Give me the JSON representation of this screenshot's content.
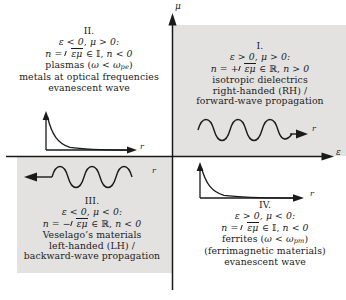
{
  "figure": {
    "name": "epsilon-mu-quadrant-diagram",
    "axis_vertical_label": "μ",
    "axis_horizontal_label": "ε",
    "shade_color": "#e3e2e0",
    "ink_color": "#1a1a1a"
  },
  "quadrants": {
    "q1": {
      "numeral": "I.",
      "condition": "ε > 0, μ > 0:",
      "index_prefix": "n = +",
      "index_radicand": "εμ",
      "index_set": "∈ ℝ,",
      "index_sign": "n > 0",
      "desc1": "isotropic dielectrics",
      "desc2": "right-handed (RH) /",
      "desc3": "forward-wave propagation",
      "inset": {
        "type": "forward-wave",
        "direction": "right",
        "label": "r",
        "cycles": 3
      }
    },
    "q2": {
      "numeral": "II.",
      "condition": "ε < 0, μ > 0:",
      "index_prefix": "n = ",
      "index_radicand": "εμ",
      "index_set": "∈ 𝕀,",
      "index_sign": "n < 0",
      "desc1_pre": "plasmas (",
      "desc1_omega": "ω",
      "desc1_mid": " < ",
      "desc1_omega2": "ω",
      "desc1_sub": "pe",
      "desc1_post": ")",
      "desc2": "metals at optical frequencies",
      "desc3": "evanescent wave",
      "inset": {
        "type": "evanescent-decay",
        "label": "r"
      }
    },
    "q3": {
      "numeral": "III.",
      "condition": "ε < 0, μ < 0:",
      "index_prefix": "n = −",
      "index_radicand": "εμ",
      "index_set": "∈ ℝ,",
      "index_sign": "n < 0",
      "desc1": "Veselago’s materials",
      "desc2": "left-handed (LH) /",
      "desc3": "backward-wave propagation",
      "inset": {
        "type": "backward-wave",
        "direction": "left",
        "label": "r",
        "cycles": 3
      }
    },
    "q4": {
      "numeral": "IV.",
      "condition": "ε > 0, μ < 0:",
      "index_prefix": "n = ",
      "index_radicand": "εμ",
      "index_set": "∈ 𝕀,",
      "index_sign": "n < 0",
      "desc1_pre": "ferrites (",
      "desc1_omega": "ω",
      "desc1_mid": " < ",
      "desc1_omega2": "ω",
      "desc1_sub": "pm",
      "desc1_post": ")",
      "desc2": "(ferrimagnetic materials)",
      "desc3": "evanescent wave",
      "inset": {
        "type": "evanescent-decay",
        "label": "r"
      }
    }
  }
}
